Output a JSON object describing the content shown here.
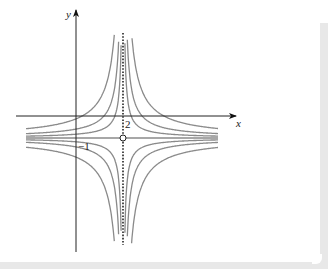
{
  "figure": {
    "x_axis_label": "x",
    "y_axis_label": "y",
    "tick_labels": {
      "x_asymptote": "2",
      "y_asymptote": "−1"
    },
    "function_family": "y = -1 + k/(x - 2)",
    "vertical_asymptote": 2,
    "horizontal_asymptote": -1,
    "open_point": [
      2,
      -1
    ],
    "colors": {
      "curves": "#8a8a8a",
      "axes": "#222222",
      "asymptote_horizontal": "#8a8a8a",
      "asymptote_vertical": "#222222",
      "frame": "#e8e8e8"
    }
  },
  "chart_data": {
    "type": "line",
    "title": "",
    "xlabel": "x",
    "ylabel": "y",
    "annotations": [
      "2",
      "−1"
    ],
    "asymptotes": {
      "vertical": "x = 2 (dotted)",
      "horizontal": "y = -1"
    },
    "series": [
      {
        "name": "k=0.5",
        "formula": "y = -1 + 0.5/(x-2)"
      },
      {
        "name": "k=1",
        "formula": "y = -1 + 1/(x-2)"
      },
      {
        "name": "k=2",
        "formula": "y = -1 + 2/(x-2)"
      },
      {
        "name": "k=-0.5",
        "formula": "y = -1 - 0.5/(x-2)"
      },
      {
        "name": "k=-1",
        "formula": "y = -1 - 1/(x-2)"
      },
      {
        "name": "k=-2",
        "formula": "y = -1 - 2/(x-2)"
      }
    ],
    "grid": false
  }
}
